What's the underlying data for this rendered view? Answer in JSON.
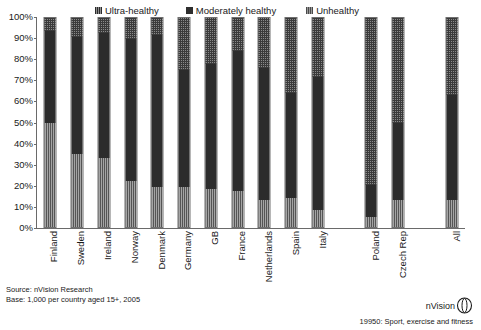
{
  "top_caption": "",
  "legend": {
    "items": [
      {
        "label": "Ultra-healthy",
        "swatch": "ultra-healthy-swatch",
        "color": "#8a8a8a"
      },
      {
        "label": "Moderately healthy",
        "swatch": "moderately-healthy-swatch",
        "color": "#2c2c2c"
      },
      {
        "label": "Unhealthy",
        "swatch": "unhealthy-swatch",
        "color": "#a5a5a5"
      }
    ]
  },
  "source": {
    "line1": "Source: nVision Research",
    "line2": "Base: 1,000 per country aged 15+, 2005"
  },
  "brand": {
    "name": "nVision",
    "logo_icon": "nvision-ring-logo"
  },
  "footnote": "19950: Sport, exercise and fitness",
  "chart_data": {
    "type": "bar",
    "stacked": true,
    "stack_mode": "100%",
    "title": "",
    "xlabel": "",
    "ylabel": "",
    "ylim": [
      0,
      100
    ],
    "yticks": [
      "0%",
      "10%",
      "20%",
      "30%",
      "40%",
      "50%",
      "60%",
      "70%",
      "80%",
      "90%",
      "100%"
    ],
    "grid": false,
    "legend_position": "top",
    "categories": [
      "Finland",
      "Sweden",
      "Ireland",
      "Norway",
      "Denmark",
      "Germany",
      "GB",
      "France",
      "Netherlands",
      "Spain",
      "Italy",
      "",
      "Poland",
      "Czech Rep",
      "",
      "All"
    ],
    "series": [
      {
        "name": "Unhealthy",
        "color": "#a5a5a5",
        "values": [
          50,
          35,
          33,
          22,
          19,
          19,
          18,
          17,
          13,
          14,
          8,
          null,
          5,
          13,
          null,
          13
        ]
      },
      {
        "name": "Moderately healthy",
        "color": "#2c2c2c",
        "values": [
          44,
          56,
          60,
          68,
          73,
          56,
          60,
          67,
          63,
          50,
          64,
          null,
          15,
          37,
          null,
          50
        ]
      },
      {
        "name": "Ultra-healthy",
        "color": "#8a8a8a",
        "values": [
          6,
          9,
          7,
          10,
          8,
          25,
          22,
          16,
          24,
          36,
          28,
          null,
          80,
          50,
          null,
          37
        ]
      }
    ]
  }
}
